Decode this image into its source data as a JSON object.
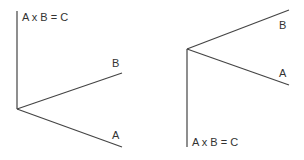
{
  "colors": {
    "background": "#ffffff",
    "line": "#444444",
    "text": "#333333"
  },
  "figures": [
    {
      "name": "left-diagram",
      "description": "Cross product A x B = C pointing up",
      "origin": [
        17,
        109
      ],
      "vectors": {
        "c": {
          "label": "A x B = C",
          "end": [
            17,
            11
          ],
          "label_pos": [
            22,
            21
          ]
        },
        "b": {
          "label": "B",
          "end": [
            122,
            73
          ],
          "label_pos": [
            112,
            67
          ]
        },
        "a": {
          "label": "A",
          "end": [
            122,
            147
          ],
          "label_pos": [
            112,
            139
          ]
        }
      }
    },
    {
      "name": "right-diagram",
      "description": "Cross product A x B = C pointing down",
      "origin": [
        187,
        49
      ],
      "vectors": {
        "c": {
          "label": "A x B = C",
          "end": [
            187,
            147
          ],
          "label_pos": [
            192,
            146
          ]
        },
        "b": {
          "label": "B",
          "end": [
            289,
            10
          ],
          "label_pos": [
            279,
            29
          ]
        },
        "a": {
          "label": "A",
          "end": [
            289,
            85
          ],
          "label_pos": [
            279,
            77
          ]
        }
      }
    }
  ]
}
